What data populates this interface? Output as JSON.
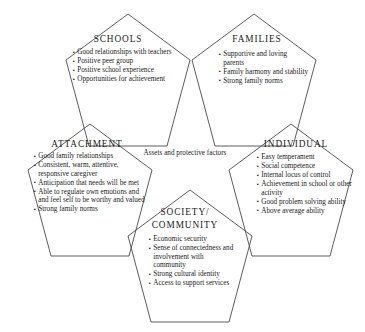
{
  "diagram": {
    "center_label": "Assets and protective factors",
    "stroke_color": "#4a4a4a",
    "background_color": "#ffffff",
    "text_color": "#1a1a1a",
    "nodes": [
      {
        "id": "schools",
        "title": "SCHOOLS",
        "items": [
          "Good relationships with teachers",
          "Positive peer group",
          "Positive school experience",
          "Opportunities for achievement"
        ]
      },
      {
        "id": "families",
        "title": "FAMILIES",
        "items": [
          "Supportive and loving parents",
          "Family harmony and stability",
          "Strong family norms"
        ]
      },
      {
        "id": "attachment",
        "title": "ATTACHMENT",
        "items": [
          "Good family relationships",
          "Consistent, warm, attentive, responsive caregiver",
          "Anticipation that needs will be met",
          "Able to regulate own emotions and and feel self to be worthy and valued",
          "Strong family norms"
        ]
      },
      {
        "id": "individual",
        "title": "INDIVIDUAL",
        "items": [
          "Easy temperament",
          "Social competence",
          "Internal locus of control",
          "Achievement in school or other activity",
          "Good problem solving ability",
          "Above average ability"
        ]
      },
      {
        "id": "society",
        "title": "SOCIETY/\nCOMMUNITY",
        "items": [
          "Economic security",
          "Sense of connectedness and involvement with community",
          "Strong cultural identity",
          "Access to support services"
        ]
      }
    ]
  }
}
